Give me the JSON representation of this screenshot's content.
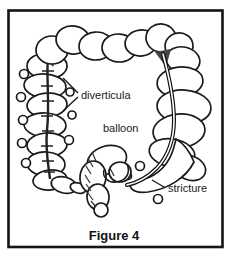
{
  "figure": {
    "caption": "Figure 4",
    "labels": {
      "diverticula": "diverticula",
      "balloon": "balloon",
      "stricture": "stricture"
    },
    "colors": {
      "ink": "#1a1a1a",
      "background": "#ffffff",
      "flexure_shadow": "#444444"
    }
  }
}
